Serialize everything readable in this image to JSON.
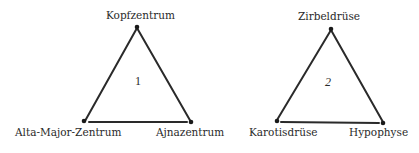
{
  "diagram": {
    "triangles": [
      {
        "number": "1",
        "vertices": {
          "top": {
            "label": "Kopfzentrum"
          },
          "bottom_left": {
            "label": "Alta-Major-Zentrum"
          },
          "bottom_right": {
            "label": "Ajnazentrum"
          }
        }
      },
      {
        "number": "2",
        "vertices": {
          "top": {
            "label": "Zirbeldrüse"
          },
          "bottom_left": {
            "label": "Karotisdrüse"
          },
          "bottom_right": {
            "label": "Hypophyse"
          }
        }
      }
    ],
    "colors": {
      "line": "#2a2a2a",
      "background": "#ffffff"
    }
  }
}
